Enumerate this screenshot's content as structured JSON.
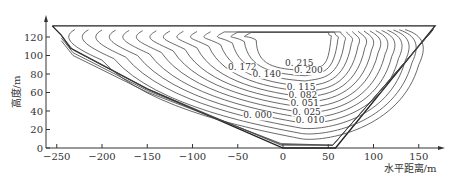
{
  "chart_data": {
    "type": "contour",
    "title": "",
    "xlabel": "水平距离/m",
    "ylabel": "高度/m",
    "xlim": [
      -255,
      175
    ],
    "ylim": [
      0,
      135
    ],
    "x_ticks": [
      -250,
      -200,
      -150,
      -100,
      -50,
      0,
      50,
      100,
      150
    ],
    "x_tick_labels": [
      "-250",
      "-200",
      "-150",
      "-100",
      "-50",
      "0",
      "50",
      "100",
      "150"
    ],
    "y_ticks": [
      0,
      20,
      40,
      60,
      80,
      100,
      120
    ],
    "y_tick_labels": [
      "0",
      "20",
      "40",
      "60",
      "80",
      "100",
      "120"
    ],
    "grid": false,
    "legend": null,
    "domain_boundary": {
      "description": "Inverted trapezoid / valley cross-section",
      "points": [
        [
          -255,
          132
        ],
        [
          -245,
          122
        ],
        [
          -235,
          108
        ],
        [
          -150,
          64
        ],
        [
          0,
          0
        ],
        [
          58,
          0
        ],
        [
          168,
          132
        ]
      ]
    },
    "contour_levels": [
      0.0,
      0.01,
      0.025,
      0.051,
      0.082,
      0.115,
      0.14,
      0.172,
      0.2,
      0.215
    ],
    "contour_labels": [
      {
        "value": "0.215",
        "x": 18,
        "y": 89
      },
      {
        "value": "0.200",
        "x": 28,
        "y": 81
      },
      {
        "value": "0.172",
        "x": -45,
        "y": 84
      },
      {
        "value": "0.140",
        "x": -18,
        "y": 77
      },
      {
        "value": "0.115",
        "x": 20,
        "y": 63
      },
      {
        "value": "0.082",
        "x": 22,
        "y": 54
      },
      {
        "value": "0.051",
        "x": 24,
        "y": 45
      },
      {
        "value": "0.025",
        "x": 26,
        "y": 36
      },
      {
        "value": "0.000",
        "x": -28,
        "y": 32
      },
      {
        "value": "0.010",
        "x": 30,
        "y": 27
      }
    ],
    "max_region_center": [
      15,
      100
    ]
  }
}
